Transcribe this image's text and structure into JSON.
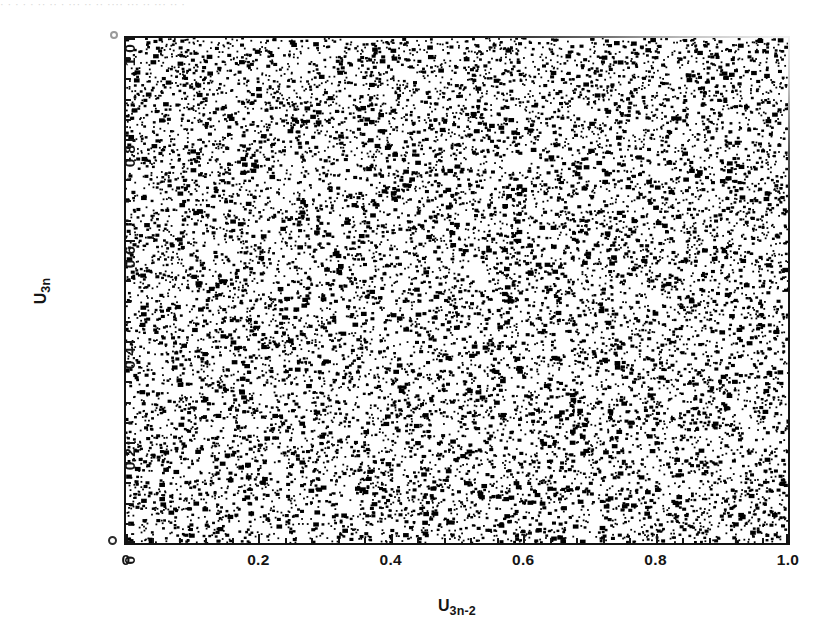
{
  "figure": {
    "top_caption_remnant": "· · ·   · ·  ·· ·· · ··· ·· ·· ···· ··· ·· ··· ·· ·",
    "background_color": "#ffffff",
    "ink_color": "#141414"
  },
  "axes": {
    "x_title_base": "U",
    "x_title_sub": "3n-2",
    "y_title_base": "U",
    "y_title_sub": "3n"
  },
  "chart_data": {
    "type": "scatter",
    "title": "",
    "subtitle": "",
    "xlabel": "U_3n-2",
    "ylabel": "U_3n",
    "xlim": [
      0,
      1
    ],
    "ylim": [
      0,
      1
    ],
    "grid": false,
    "legend": null,
    "legend_position": "none",
    "x_tick_labels": [
      "0",
      "0.2",
      "0.4",
      "0.6",
      "0.8",
      "1.0"
    ],
    "x_tick_values": [
      0,
      0.2,
      0.4,
      0.6,
      0.8,
      1.0
    ],
    "y_tick_labels": [
      "0",
      "0.2",
      "0.4",
      "0.6",
      "0.8",
      "1.0"
    ],
    "y_tick_values": [
      0,
      0.2,
      0.4,
      0.6,
      0.8,
      1.0
    ],
    "minor_ticks_per_interval": 4,
    "tick_direction": "in",
    "marker": "point",
    "marker_color": "#000000",
    "marker_size_px": 2.1,
    "n_points": 12000,
    "distribution": "uniform-random-2d",
    "point_density_per_unit_area": 12000,
    "random_seed": 20240517,
    "series": [
      {
        "name": "pairs",
        "n": 12000,
        "x_range": [
          0,
          1
        ],
        "y_range": [
          0,
          1
        ]
      }
    ]
  }
}
